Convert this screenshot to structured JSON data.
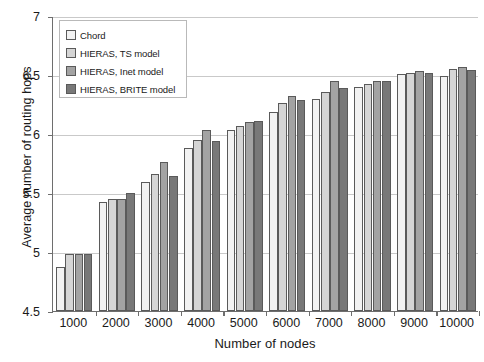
{
  "chart_data": {
    "type": "bar",
    "title": "",
    "xlabel": "Number of nodes",
    "ylabel": "Average number of routing hops",
    "ylim": [
      4.5,
      7
    ],
    "ytick_labels": [
      "4.5",
      "5",
      "5.5",
      "6",
      "6.5",
      "7"
    ],
    "yticks": [
      4.5,
      5,
      5.5,
      6,
      6.5,
      7
    ],
    "grid": true,
    "legend_position": "upper-left",
    "categories": [
      "1000",
      "2000",
      "3000",
      "4000",
      "5000",
      "6000",
      "7000",
      "8000",
      "9000",
      "10000"
    ],
    "series": [
      {
        "name": "Chord",
        "color": "#f2f2f2",
        "values": [
          4.87,
          5.42,
          5.59,
          5.88,
          6.03,
          6.19,
          6.3,
          6.4,
          6.51,
          6.49
        ]
      },
      {
        "name": "HIERAS, TS model",
        "color": "#d5d5d5",
        "values": [
          4.98,
          5.45,
          5.66,
          5.95,
          6.07,
          6.26,
          6.36,
          6.42,
          6.52,
          6.55
        ]
      },
      {
        "name": "HIERAS, Inet model",
        "color": "#a3a3a3",
        "values": [
          4.98,
          5.45,
          5.76,
          6.03,
          6.1,
          6.32,
          6.45,
          6.45,
          6.53,
          6.57
        ]
      },
      {
        "name": "HIERAS, BRITE model",
        "color": "#787878",
        "values": [
          4.98,
          5.5,
          5.64,
          5.94,
          6.11,
          6.29,
          6.39,
          6.45,
          6.52,
          6.54
        ]
      }
    ]
  },
  "legend": {
    "items": [
      {
        "label": "Chord"
      },
      {
        "label": "HIERAS, TS model"
      },
      {
        "label": "HIERAS, Inet model"
      },
      {
        "label": "HIERAS, BRITE  model"
      }
    ]
  }
}
